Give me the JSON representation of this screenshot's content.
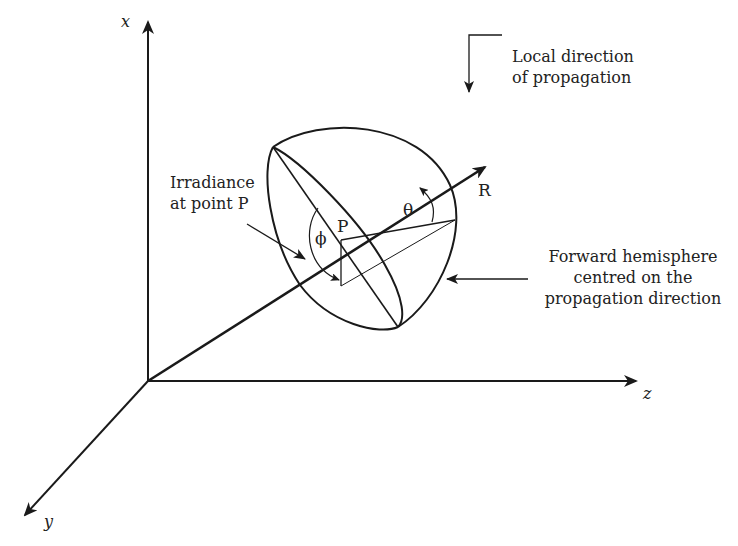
{
  "diagram": {
    "axes": {
      "x_label": "x",
      "y_label": "y",
      "z_label": "z",
      "r_label": "R"
    },
    "symbols": {
      "point": "P",
      "theta": "θ",
      "phi": "ϕ"
    },
    "annotations": {
      "local_direction": [
        "Local direction",
        "of propagation"
      ],
      "irradiance": [
        "Irradiance",
        "at point P"
      ],
      "hemisphere": [
        "Forward hemisphere",
        "centred on the",
        "propagation direction"
      ]
    },
    "colors": {
      "stroke": "#1a1a1a",
      "text": "#222222",
      "background": "#ffffff"
    }
  }
}
